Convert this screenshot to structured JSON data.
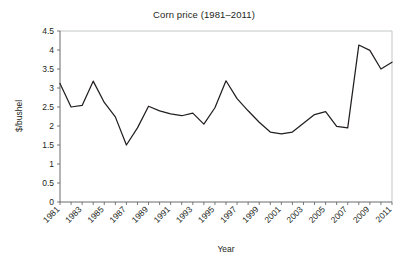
{
  "chart_data": {
    "type": "line",
    "title": "Corn price (1981–2011)",
    "xlabel": "Year",
    "ylabel": "$/bushel",
    "grid": false,
    "legend": null,
    "xlim": [
      1981,
      2011
    ],
    "ylim": [
      0,
      4.5
    ],
    "ytick_labels": [
      "0",
      "0.5",
      "1",
      "1.5",
      "2",
      "2.5",
      "3",
      "3.5",
      "4",
      "4.5"
    ],
    "ytick_values": [
      0,
      0.5,
      1,
      1.5,
      2,
      2.5,
      3,
      3.5,
      4,
      4.5
    ],
    "xtick_labels": [
      "1981",
      "1983",
      "1985",
      "1987",
      "1989",
      "1991",
      "1993",
      "1995",
      "1997",
      "1999",
      "2001",
      "2003",
      "2005",
      "2007",
      "2009",
      "2011"
    ],
    "xtick_values": [
      1981,
      1983,
      1985,
      1987,
      1989,
      1991,
      1993,
      1995,
      1997,
      1999,
      2001,
      2003,
      2005,
      2007,
      2009,
      2011
    ],
    "xtick_label_rotation": 45,
    "x": [
      1981,
      1982,
      1983,
      1984,
      1985,
      1986,
      1987,
      1988,
      1989,
      1990,
      1991,
      1992,
      1993,
      1994,
      1995,
      1996,
      1997,
      1998,
      1999,
      2000,
      2001,
      2002,
      2003,
      2004,
      2005,
      2006,
      2007,
      2008,
      2009,
      2010,
      2011
    ],
    "values": [
      3.12,
      2.5,
      2.54,
      3.18,
      2.62,
      2.24,
      1.5,
      1.95,
      2.52,
      2.4,
      2.32,
      2.27,
      2.34,
      2.05,
      2.48,
      3.19,
      2.72,
      2.4,
      2.1,
      1.84,
      1.79,
      1.84,
      2.07,
      2.3,
      2.38,
      1.99,
      1.95,
      4.13,
      3.99,
      3.5,
      3.68
    ],
    "series": [
      {
        "name": "Corn price",
        "color": "#231f20",
        "values": [
          3.12,
          2.5,
          2.54,
          3.18,
          2.62,
          2.24,
          1.5,
          1.95,
          2.52,
          2.4,
          2.32,
          2.27,
          2.34,
          2.05,
          2.48,
          3.19,
          2.72,
          2.4,
          2.1,
          1.84,
          1.79,
          1.84,
          2.07,
          2.3,
          2.38,
          1.99,
          1.95,
          4.13,
          3.99,
          3.5,
          3.68
        ]
      }
    ]
  }
}
